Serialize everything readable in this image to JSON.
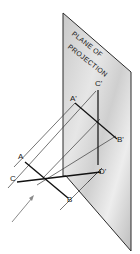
{
  "figure": {
    "plane_title_line1": "PLANE OF",
    "plane_title_line2": "PROJECTION",
    "points": {
      "A": "A",
      "B": "B",
      "C": "C",
      "A_prime": "A'",
      "B_prime": "B'",
      "C_prime": "C'",
      "D_prime": "D'"
    }
  },
  "colors": {
    "plane_fill": "#d9d9d9",
    "plane_edge": "#2b2b2b",
    "object_line": "#111111",
    "projector_line": "#3a3a3a",
    "arrow": "#8a8a8a"
  }
}
